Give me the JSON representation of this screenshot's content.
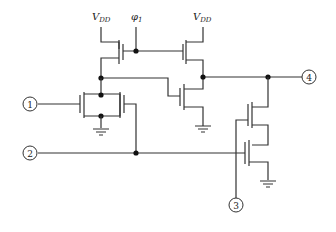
{
  "diagram": {
    "type": "transistor-schematic",
    "supply_labels": {
      "vdd_left": {
        "main": "V",
        "sub": "DD"
      },
      "vdd_right": {
        "main": "V",
        "sub": "DD"
      },
      "clock": {
        "main": "φ",
        "sub": "1"
      }
    },
    "pins": [
      {
        "id": "1",
        "label": "1"
      },
      {
        "id": "2",
        "label": "2"
      },
      {
        "id": "3",
        "label": "3"
      },
      {
        "id": "4",
        "label": "4"
      }
    ],
    "colors": {
      "wire": "#333333",
      "node": "#111111",
      "background": "#ffffff"
    }
  }
}
